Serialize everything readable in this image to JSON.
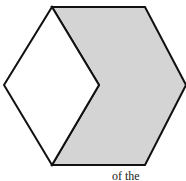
{
  "figure": {
    "fill_color": "#d4d4d4",
    "stroke_color": "#111111",
    "background": "#ffffff"
  },
  "caption": {
    "text": "of the"
  }
}
